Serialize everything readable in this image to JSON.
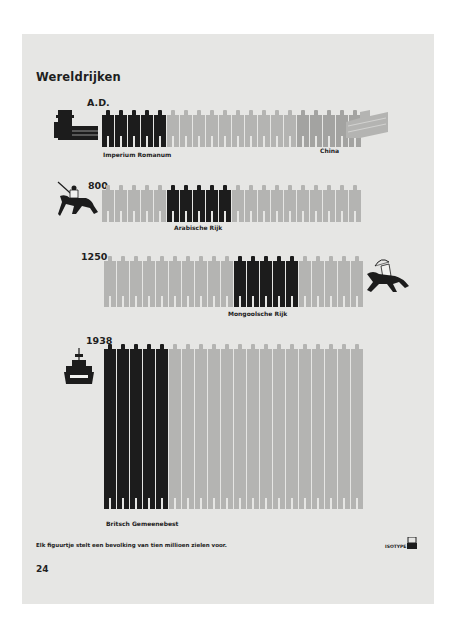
{
  "page": {
    "title": "Wereldrijken",
    "footer_note": "Elk figuurtje stelt een bevolking van tien millioen zielen voor.",
    "page_number": "24",
    "logo": "ISOTYPE"
  },
  "colors": {
    "dark": "#1c1c1c",
    "light": "#b4b4b2",
    "medium": "#a3a3a1",
    "mid_dark": "#4a4a4a",
    "paper": "#e6e6e4"
  },
  "rows": [
    {
      "year": "A.D.",
      "icon": "roman-gate-icon",
      "empire": "Imperium Romanum",
      "other_label": "China"
    },
    {
      "year": "800",
      "icon": "horseman-lancer-icon",
      "empire": "Arabische Rijk"
    },
    {
      "year": "1250",
      "icon": "mounted-archer-icon",
      "empire": "Mongoolsche Rijk"
    },
    {
      "year": "1938",
      "icon": "battleship-icon",
      "empire": "Britsch Gemeenebest"
    }
  ],
  "chart_data": {
    "type": "pictogram",
    "title": "Wereldrijken",
    "unit": "1 figure = 10 million people",
    "note": "Elk figuurtje stelt een bevolking van tien millioen zielen voor.",
    "series": [
      {
        "period": "A.D.",
        "segments": [
          {
            "name": "Imperium Romanum",
            "figures": 5,
            "shade": "dark"
          },
          {
            "name": "Other",
            "figures": 10,
            "shade": "light"
          },
          {
            "name": "China",
            "figures": 5,
            "shade": "medium"
          }
        ],
        "stack_height": 1
      },
      {
        "period": "800",
        "segments": [
          {
            "name": "Other",
            "figures": 5,
            "shade": "light"
          },
          {
            "name": "Arabische Rijk",
            "figures": 5,
            "shade": "dark"
          },
          {
            "name": "Other",
            "figures": 10,
            "shade": "light"
          }
        ],
        "stack_height": 1
      },
      {
        "period": "1250",
        "segments": [
          {
            "name": "Other",
            "figures": 10,
            "shade": "light"
          },
          {
            "name": "Mongoolsche Rijk",
            "figures": 5,
            "shade": "dark"
          },
          {
            "name": "Other",
            "figures": 5,
            "shade": "light"
          }
        ],
        "stack_height": 2
      },
      {
        "period": "1938",
        "segments": [
          {
            "name": "Britsch Gemeenebest",
            "figures": 5,
            "shade": "dark"
          },
          {
            "name": "Other",
            "figures": 15,
            "shade": "light"
          }
        ],
        "stack_height": 10
      }
    ]
  }
}
